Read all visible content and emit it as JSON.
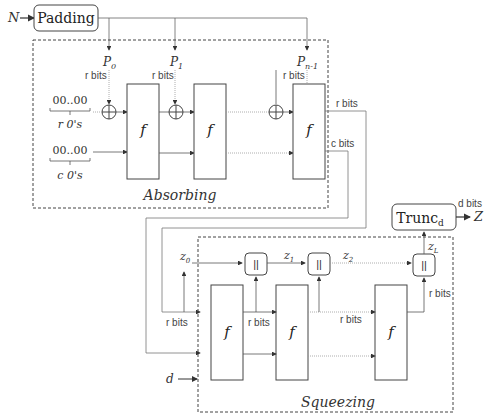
{
  "input": {
    "label": "N"
  },
  "padding": {
    "label": "Padding"
  },
  "absorbing": {
    "label": "Absorbing",
    "blocks": [
      {
        "label": "P",
        "sub": "0"
      },
      {
        "label": "P",
        "sub": "1"
      },
      {
        "label": "P",
        "sub": "n-1"
      }
    ],
    "rbits_label": "r bits",
    "r_zeros": {
      "value": "00..00",
      "caption": "r 0's"
    },
    "c_zeros": {
      "value": "00..00",
      "caption": "c 0's"
    },
    "f_label": "f",
    "out_r_label": "r bits",
    "out_c_label": "c bits"
  },
  "squeezing": {
    "label": "Squeezing",
    "f_label": "f",
    "concat_label": "||",
    "outputs": [
      {
        "label": "z",
        "sub": "0"
      },
      {
        "label": "z",
        "sub": "1"
      },
      {
        "label": "z",
        "sub": "2"
      },
      {
        "label": "z",
        "sub": "L"
      }
    ],
    "rbits_label": "r bits",
    "d_input": "d"
  },
  "trunc": {
    "label": "Trunc",
    "sub": "d",
    "out_bits": "d bits",
    "output": "Z"
  }
}
